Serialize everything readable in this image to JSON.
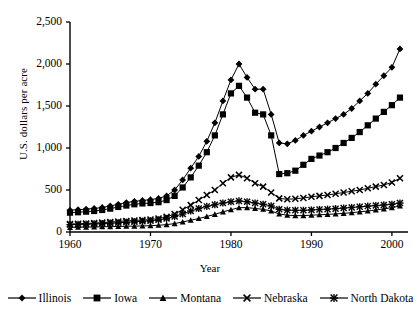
{
  "chart_data": {
    "type": "line",
    "title": "",
    "xlabel": "Year",
    "ylabel": "U.S. dollars per acre",
    "xlim": [
      1960,
      2002
    ],
    "ylim": [
      0,
      2500
    ],
    "ygrid": false,
    "xgrid": false,
    "legend_position": "bottom",
    "yticks": [
      0,
      500,
      1000,
      1500,
      2000,
      2500
    ],
    "ytick_labels": [
      "0",
      "500",
      "1,000",
      "1,500",
      "2,000",
      "2,500"
    ],
    "xticks": [
      1960,
      1970,
      1980,
      1990,
      2000
    ],
    "xtick_labels": [
      "1960",
      "1970",
      "1980",
      "1990",
      "2000"
    ],
    "x": [
      1960,
      1961,
      1962,
      1963,
      1964,
      1965,
      1966,
      1967,
      1968,
      1969,
      1970,
      1971,
      1972,
      1973,
      1974,
      1975,
      1976,
      1977,
      1978,
      1979,
      1980,
      1981,
      1982,
      1983,
      1984,
      1985,
      1986,
      1987,
      1988,
      1989,
      1990,
      1991,
      1992,
      1993,
      1994,
      1995,
      1996,
      1997,
      1998,
      1999,
      2000,
      2001
    ],
    "series": [
      {
        "name": "Illinois",
        "marker": "filled-diamond",
        "values": [
          260,
          265,
          272,
          280,
          292,
          310,
          330,
          350,
          365,
          375,
          385,
          400,
          430,
          500,
          620,
          760,
          900,
          1080,
          1300,
          1560,
          1810,
          2000,
          1840,
          1700,
          1700,
          1400,
          1060,
          1050,
          1090,
          1150,
          1200,
          1250,
          1300,
          1350,
          1400,
          1470,
          1560,
          1650,
          1760,
          1860,
          1960,
          2180
        ]
      },
      {
        "name": "Iowa",
        "marker": "filled-square",
        "values": [
          230,
          235,
          242,
          250,
          262,
          278,
          298,
          315,
          330,
          340,
          345,
          355,
          380,
          430,
          530,
          650,
          790,
          950,
          1150,
          1400,
          1650,
          1740,
          1600,
          1420,
          1400,
          1150,
          690,
          700,
          730,
          800,
          870,
          910,
          950,
          1000,
          1060,
          1120,
          1190,
          1270,
          1350,
          1430,
          1510,
          1600
        ]
      },
      {
        "name": "Montana",
        "marker": "filled-triangle",
        "values": [
          55,
          57,
          58,
          60,
          62,
          64,
          66,
          68,
          70,
          72,
          75,
          80,
          88,
          100,
          120,
          140,
          160,
          185,
          210,
          240,
          265,
          290,
          290,
          280,
          270,
          250,
          215,
          200,
          195,
          195,
          200,
          205,
          210,
          215,
          222,
          230,
          240,
          250,
          262,
          275,
          290,
          310
        ]
      },
      {
        "name": "Nebraska",
        "marker": "x-cross",
        "values": [
          95,
          98,
          102,
          106,
          112,
          118,
          125,
          132,
          138,
          142,
          148,
          160,
          180,
          215,
          265,
          320,
          380,
          440,
          500,
          580,
          650,
          680,
          640,
          580,
          540,
          470,
          400,
          390,
          395,
          405,
          420,
          430,
          440,
          455,
          470,
          485,
          500,
          520,
          540,
          560,
          590,
          640
        ]
      },
      {
        "name": "North Dakota",
        "marker": "asterisk",
        "values": [
          88,
          90,
          93,
          96,
          100,
          105,
          110,
          116,
          122,
          128,
          134,
          145,
          160,
          185,
          215,
          250,
          280,
          305,
          325,
          345,
          360,
          370,
          360,
          345,
          330,
          310,
          270,
          260,
          258,
          258,
          262,
          268,
          272,
          278,
          285,
          292,
          300,
          308,
          315,
          322,
          330,
          345
        ]
      }
    ]
  },
  "axis": {
    "ylabel": "U.S. dollars per acre",
    "xlabel": "Year"
  },
  "legend": {
    "items": [
      {
        "label": "Illinois",
        "marker": "filled-diamond"
      },
      {
        "label": "Iowa",
        "marker": "filled-square"
      },
      {
        "label": "Montana",
        "marker": "filled-triangle"
      },
      {
        "label": "Nebraska",
        "marker": "x-cross"
      },
      {
        "label": "North Dakota",
        "marker": "asterisk"
      }
    ]
  }
}
